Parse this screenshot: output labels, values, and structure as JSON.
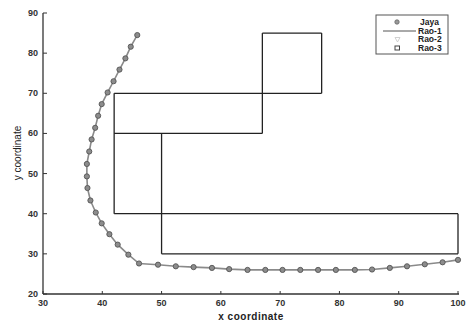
{
  "chart_data": {
    "type": "line",
    "title": "",
    "xlabel": "x coordinate",
    "ylabel": "y coordinate",
    "xlim": [
      30,
      100
    ],
    "ylim": [
      20,
      90
    ],
    "xticks": [
      30,
      40,
      50,
      60,
      70,
      80,
      90,
      100
    ],
    "yticks": [
      20,
      30,
      40,
      50,
      60,
      70,
      80,
      90
    ],
    "grid": false,
    "legend_position": "upper right",
    "legend": [
      "Jaya",
      "Rao-1",
      "Rao-2",
      "Rao-3"
    ],
    "series": [
      {
        "name": "Jaya",
        "style": "line-with-circle-markers",
        "color": "#7a7a7a",
        "points": [
          [
            45.9,
            84.5
          ],
          [
            44.8,
            81.6
          ],
          [
            43.9,
            78.7
          ],
          [
            42.9,
            75.9
          ],
          [
            41.9,
            73.0
          ],
          [
            40.9,
            70.2
          ],
          [
            39.9,
            67.3
          ],
          [
            39.3,
            64.4
          ],
          [
            38.8,
            61.4
          ],
          [
            38.2,
            58.5
          ],
          [
            37.8,
            55.5
          ],
          [
            37.4,
            52.4
          ],
          [
            37.4,
            49.3
          ],
          [
            37.5,
            46.4
          ],
          [
            38.0,
            43.3
          ],
          [
            38.9,
            40.3
          ],
          [
            39.9,
            37.6
          ],
          [
            41.2,
            34.9
          ],
          [
            42.6,
            32.3
          ],
          [
            44.4,
            29.8
          ],
          [
            46.2,
            27.6
          ],
          [
            49.4,
            27.3
          ],
          [
            52.4,
            26.9
          ],
          [
            55.4,
            26.7
          ],
          [
            58.5,
            26.5
          ],
          [
            61.4,
            26.2
          ],
          [
            64.5,
            26.0
          ],
          [
            67.5,
            26.0
          ],
          [
            70.4,
            26.0
          ],
          [
            73.4,
            26.0
          ],
          [
            76.4,
            26.0
          ],
          [
            79.4,
            26.0
          ],
          [
            82.6,
            26.0
          ],
          [
            85.5,
            26.1
          ],
          [
            88.5,
            26.5
          ],
          [
            91.4,
            26.9
          ],
          [
            94.4,
            27.4
          ],
          [
            97.4,
            27.9
          ],
          [
            100.0,
            28.5
          ]
        ]
      },
      {
        "name": "Rao-1",
        "style": "line",
        "color": "#222222",
        "segments": [
          [
            [
              42,
              40
            ],
            [
              42,
              70
            ]
          ],
          [
            [
              42,
              70
            ],
            [
              77,
              70
            ]
          ],
          [
            [
              77,
              70
            ],
            [
              77,
              85
            ]
          ],
          [
            [
              77,
              85
            ],
            [
              67,
              85
            ]
          ],
          [
            [
              67,
              85
            ],
            [
              67,
              60
            ]
          ],
          [
            [
              67,
              60
            ],
            [
              42,
              60
            ]
          ],
          [
            [
              50,
              60
            ],
            [
              50,
              30
            ]
          ],
          [
            [
              50,
              30
            ],
            [
              100,
              30
            ]
          ],
          [
            [
              100,
              30
            ],
            [
              100,
              40
            ]
          ],
          [
            [
              100,
              40
            ],
            [
              42,
              40
            ]
          ]
        ]
      },
      {
        "name": "Rao-2",
        "style": "triangle-markers",
        "color": "#cccccc",
        "points": []
      },
      {
        "name": "Rao-3",
        "style": "square-markers",
        "color": "#444444",
        "points": []
      }
    ]
  }
}
